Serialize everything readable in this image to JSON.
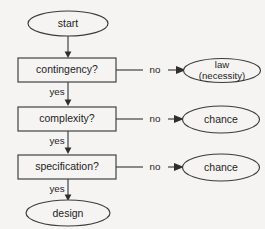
{
  "diagram": {
    "background_color": "#f5f4f2",
    "stroke_color": "#3b3b3b",
    "text_color": "#1e1e1e"
  },
  "nodes": {
    "start": {
      "label": "start",
      "shape": "ellipse"
    },
    "contingency": {
      "label": "contingency?",
      "shape": "rectangle"
    },
    "complexity": {
      "label": "complexity?",
      "shape": "rectangle"
    },
    "specification": {
      "label": "specification?",
      "shape": "rectangle"
    },
    "design": {
      "label": "design",
      "shape": "ellipse"
    },
    "law": {
      "label_line1": "law",
      "label_line2": "(necessity)",
      "shape": "ellipse"
    },
    "chance1": {
      "label": "chance",
      "shape": "ellipse"
    },
    "chance2": {
      "label": "chance",
      "shape": "ellipse"
    }
  },
  "edges": {
    "start_to_contingency": {
      "label": ""
    },
    "contingency_no": {
      "label": "no"
    },
    "contingency_yes": {
      "label": "yes"
    },
    "complexity_no": {
      "label": "no"
    },
    "complexity_yes": {
      "label": "yes"
    },
    "specification_no": {
      "label": "no"
    },
    "specification_yes": {
      "label": "yes"
    }
  }
}
